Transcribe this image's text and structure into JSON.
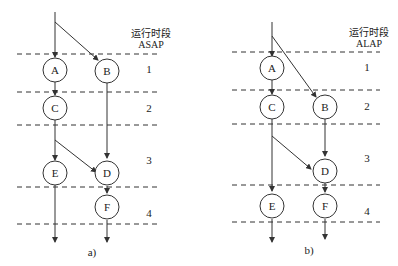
{
  "panels": [
    {
      "id": "a",
      "caption": "a)",
      "header_line1": "运行时段",
      "header_line2": "ASAP",
      "steps": [
        "1",
        "2",
        "3",
        "4"
      ],
      "nodes": [
        {
          "label": "A",
          "step": 1,
          "col": 0
        },
        {
          "label": "B",
          "step": 1,
          "col": 1
        },
        {
          "label": "C",
          "step": 2,
          "col": 0
        },
        {
          "label": "E",
          "step": 3,
          "col": 0
        },
        {
          "label": "D",
          "step": 3,
          "col": 1
        },
        {
          "label": "F",
          "step": 4,
          "col": 1
        }
      ],
      "edges": [
        [
          "in",
          "A"
        ],
        [
          "in",
          "B"
        ],
        [
          "A",
          "C"
        ],
        [
          "C",
          "E"
        ],
        [
          "C",
          "D"
        ],
        [
          "B",
          "D"
        ],
        [
          "D",
          "F"
        ],
        [
          "E",
          "out"
        ],
        [
          "F",
          "out"
        ]
      ]
    },
    {
      "id": "b",
      "caption": "b)",
      "header_line1": "运行时段",
      "header_line2": "ALAP",
      "steps": [
        "1",
        "2",
        "3",
        "4"
      ],
      "nodes": [
        {
          "label": "A",
          "step": 1,
          "col": 0
        },
        {
          "label": "C",
          "step": 2,
          "col": 0
        },
        {
          "label": "B",
          "step": 2,
          "col": 1
        },
        {
          "label": "D",
          "step": 3,
          "col": 1
        },
        {
          "label": "E",
          "step": 4,
          "col": 0
        },
        {
          "label": "F",
          "step": 4,
          "col": 1
        }
      ],
      "edges": [
        [
          "in",
          "A"
        ],
        [
          "in",
          "B"
        ],
        [
          "A",
          "C"
        ],
        [
          "C",
          "E"
        ],
        [
          "C",
          "D"
        ],
        [
          "B",
          "D"
        ],
        [
          "D",
          "F"
        ],
        [
          "E",
          "out"
        ],
        [
          "F",
          "out"
        ]
      ]
    }
  ]
}
